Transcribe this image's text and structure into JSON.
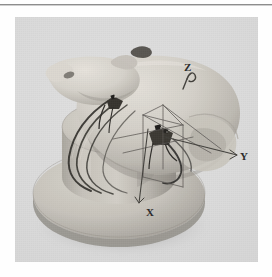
{
  "page": {
    "background_color": "#fefefe",
    "rule_color": "#8d8d8d"
  },
  "figure": {
    "name": "rat-head-stereotaxic-photo",
    "background_color": "#dcdcdc",
    "specimen_color": "#cfcbc4",
    "pedestal_color": "#c2bfb8",
    "wire_color": "#2b2b2b",
    "axis_line_color": "#4a4a4a",
    "axis_label_color": "#2a2a2a",
    "axes": [
      {
        "id": "x",
        "label": "X",
        "x": 131,
        "y": 190
      },
      {
        "id": "y",
        "label": "Y",
        "x": 225,
        "y": 134
      },
      {
        "id": "z",
        "label": "Z",
        "x": 169,
        "y": 45
      }
    ]
  }
}
